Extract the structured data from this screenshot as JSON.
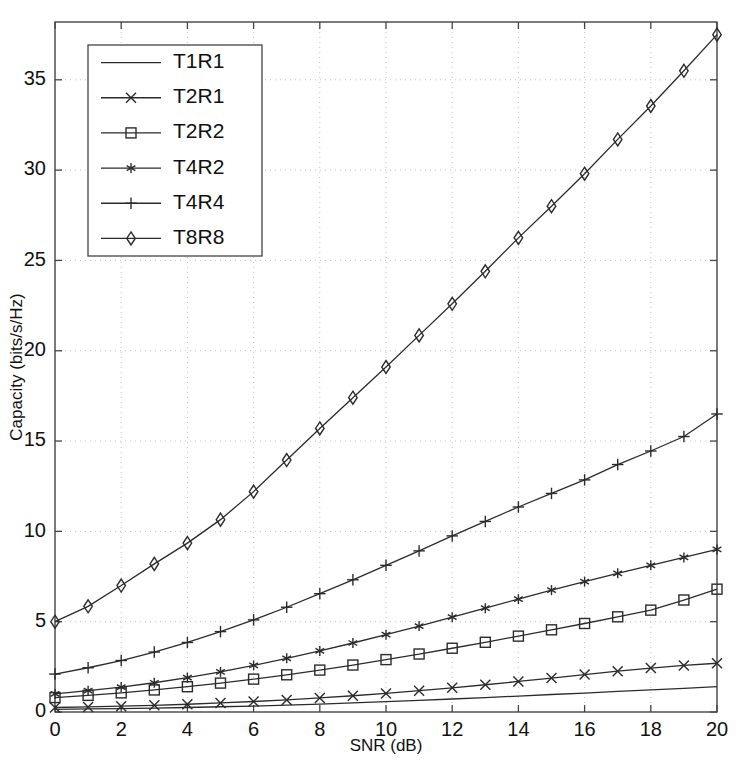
{
  "chart_data": {
    "type": "line",
    "title": "",
    "xlabel": "SNR (dB)",
    "ylabel": "Capacity (bits/s/Hz)",
    "xlim": [
      0,
      20
    ],
    "ylim": [
      0,
      38.2
    ],
    "xticks": [
      0,
      2,
      4,
      6,
      8,
      10,
      12,
      14,
      16,
      18,
      20
    ],
    "yticks": [
      0,
      5,
      10,
      15,
      20,
      25,
      30,
      35
    ],
    "xticklabels": [
      "0",
      "2",
      "4",
      "6",
      "8",
      "10",
      "12",
      "14",
      "16",
      "18",
      "20"
    ],
    "yticklabels": [
      "0",
      "5",
      "10",
      "15",
      "20",
      "25",
      "30",
      "35"
    ],
    "grid": true,
    "grid_style": "dotted",
    "legend_position": "upper left",
    "x": [
      0,
      1,
      2,
      3,
      4,
      5,
      6,
      7,
      8,
      9,
      10,
      11,
      12,
      13,
      14,
      15,
      16,
      17,
      18,
      19,
      20
    ],
    "series": [
      {
        "name": "T1R1",
        "marker": "none",
        "values": [
          0.15,
          0.17,
          0.19,
          0.22,
          0.25,
          0.29,
          0.33,
          0.38,
          0.44,
          0.5,
          0.57,
          0.64,
          0.72,
          0.8,
          0.88,
          0.97,
          1.05,
          1.14,
          1.23,
          1.31,
          1.4
        ]
      },
      {
        "name": "T2R1",
        "marker": "cross",
        "values": [
          0.25,
          0.28,
          0.32,
          0.37,
          0.43,
          0.5,
          0.58,
          0.67,
          0.78,
          0.9,
          1.03,
          1.18,
          1.34,
          1.51,
          1.69,
          1.88,
          2.07,
          2.26,
          2.43,
          2.58,
          2.7
        ]
      },
      {
        "name": "T2R2",
        "marker": "square",
        "values": [
          0.8,
          0.92,
          1.06,
          1.22,
          1.4,
          1.6,
          1.82,
          2.06,
          2.32,
          2.6,
          2.9,
          3.21,
          3.53,
          3.86,
          4.2,
          4.55,
          4.9,
          5.27,
          5.64,
          6.2,
          6.8
        ]
      },
      {
        "name": "T4R2",
        "marker": "asterisk",
        "values": [
          1.0,
          1.18,
          1.38,
          1.62,
          1.9,
          2.22,
          2.58,
          2.97,
          3.38,
          3.82,
          4.28,
          4.76,
          5.25,
          5.75,
          6.25,
          6.75,
          7.22,
          7.68,
          8.12,
          8.56,
          9.0
        ]
      },
      {
        "name": "T4R4",
        "marker": "plus",
        "values": [
          2.1,
          2.45,
          2.85,
          3.32,
          3.85,
          4.45,
          5.1,
          5.8,
          6.55,
          7.32,
          8.12,
          8.92,
          9.75,
          10.55,
          11.35,
          12.1,
          12.85,
          13.7,
          14.45,
          15.25,
          16.5
        ]
      },
      {
        "name": "T8R8",
        "marker": "diamond",
        "values": [
          5.0,
          5.85,
          7.0,
          8.2,
          9.35,
          10.65,
          12.2,
          13.95,
          15.7,
          17.4,
          19.1,
          20.85,
          22.6,
          24.4,
          26.25,
          28.0,
          29.8,
          31.7,
          33.55,
          35.5,
          37.5
        ]
      }
    ]
  },
  "legend": {
    "entries": [
      {
        "label": "T1R1"
      },
      {
        "label": "T2R1"
      },
      {
        "label": "T2R2"
      },
      {
        "label": "T4R2"
      },
      {
        "label": "T4R4"
      },
      {
        "label": "T8R8"
      }
    ]
  },
  "colors": {
    "line": "#2b2b2b",
    "axis": "#444444",
    "grid": "#bbbbbb",
    "background": "#ffffff"
  }
}
